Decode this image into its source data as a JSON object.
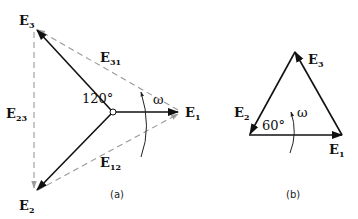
{
  "diagram_a": {
    "caption": "(a)",
    "angle_label": "120°",
    "omega_label": "ω",
    "phasors": {
      "E1": {
        "base": "E",
        "sub": "1"
      },
      "E2": {
        "base": "E",
        "sub": "2"
      },
      "E3": {
        "base": "E",
        "sub": "3"
      }
    },
    "line_voltages": {
      "E12": {
        "base": "E",
        "sub": "12"
      },
      "E23": {
        "base": "E",
        "sub": "23"
      },
      "E31": {
        "base": "E",
        "sub": "31"
      }
    }
  },
  "diagram_b": {
    "caption": "(b)",
    "angle_label": "60°",
    "omega_label": "ω",
    "phasors": {
      "E1": {
        "base": "E",
        "sub": "1"
      },
      "E2": {
        "base": "E",
        "sub": "2"
      },
      "E3": {
        "base": "E",
        "sub": "3"
      }
    }
  },
  "colors": {
    "solid": "#111111",
    "dashed": "#9a9a9a"
  }
}
